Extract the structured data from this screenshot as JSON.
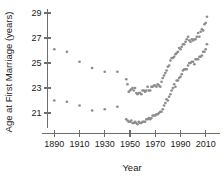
{
  "chart_data": {
    "type": "scatter",
    "title": "",
    "xlabel": "Year",
    "ylabel": "Age at First Marriage (years)",
    "xlim": [
      1885,
      2015
    ],
    "ylim": [
      19.9,
      29.4
    ],
    "xticks": [
      1890,
      1910,
      1930,
      1950,
      1970,
      1990,
      2010
    ],
    "yticks": [
      21,
      23,
      25,
      27,
      29
    ],
    "grid": false,
    "legend": "none",
    "point_color": "#8d8d8d",
    "axis_color": "#6e6e6e",
    "series": [
      {
        "name": "Men",
        "x": [
          1890,
          1900,
          1910,
          1920,
          1930,
          1940,
          1947,
          1948,
          1949,
          1950,
          1951,
          1952,
          1953,
          1954,
          1955,
          1956,
          1957,
          1958,
          1959,
          1960,
          1961,
          1962,
          1963,
          1964,
          1965,
          1966,
          1967,
          1968,
          1969,
          1970,
          1971,
          1972,
          1973,
          1974,
          1975,
          1976,
          1977,
          1978,
          1979,
          1980,
          1981,
          1982,
          1983,
          1984,
          1985,
          1986,
          1987,
          1988,
          1989,
          1990,
          1991,
          1992,
          1993,
          1994,
          1995,
          1996,
          1997,
          1998,
          1999,
          2000,
          2001,
          2002,
          2003,
          2004,
          2005,
          2006,
          2007,
          2008,
          2009,
          2010,
          2011
        ],
        "values": [
          26.1,
          25.9,
          25.1,
          24.6,
          24.3,
          24.3,
          23.7,
          23.3,
          22.7,
          22.8,
          22.9,
          23.0,
          22.8,
          23.0,
          22.6,
          22.5,
          22.6,
          22.6,
          22.5,
          22.8,
          22.8,
          22.7,
          22.8,
          23.1,
          22.8,
          22.8,
          23.1,
          23.1,
          23.2,
          23.2,
          23.1,
          23.3,
          23.2,
          23.1,
          23.5,
          23.8,
          24.0,
          24.2,
          24.4,
          24.7,
          24.8,
          25.2,
          25.4,
          25.4,
          25.5,
          25.7,
          25.8,
          25.9,
          26.2,
          26.1,
          26.3,
          26.5,
          26.5,
          26.7,
          26.9,
          27.1,
          26.8,
          26.7,
          26.9,
          26.8,
          26.9,
          26.9,
          27.1,
          27.4,
          27.1,
          27.5,
          27.7,
          27.6,
          28.1,
          28.2,
          28.7
        ]
      },
      {
        "name": "Women",
        "x": [
          1890,
          1900,
          1910,
          1920,
          1930,
          1940,
          1947,
          1948,
          1949,
          1950,
          1951,
          1952,
          1953,
          1954,
          1955,
          1956,
          1957,
          1958,
          1959,
          1960,
          1961,
          1962,
          1963,
          1964,
          1965,
          1966,
          1967,
          1968,
          1969,
          1970,
          1971,
          1972,
          1973,
          1974,
          1975,
          1976,
          1977,
          1978,
          1979,
          1980,
          1981,
          1982,
          1983,
          1984,
          1985,
          1986,
          1987,
          1988,
          1989,
          1990,
          1991,
          1992,
          1993,
          1994,
          1995,
          1996,
          1997,
          1998,
          1999,
          2000,
          2001,
          2002,
          2003,
          2004,
          2005,
          2006,
          2007,
          2008,
          2009,
          2010,
          2011
        ],
        "values": [
          22.0,
          21.9,
          21.6,
          21.2,
          21.3,
          21.5,
          20.5,
          20.4,
          20.3,
          20.3,
          20.4,
          20.2,
          20.2,
          20.3,
          20.2,
          20.1,
          20.3,
          20.2,
          20.2,
          20.3,
          20.3,
          20.3,
          20.5,
          20.5,
          20.6,
          20.5,
          20.6,
          20.8,
          20.8,
          20.8,
          20.9,
          20.9,
          21.0,
          21.1,
          21.1,
          21.3,
          21.6,
          21.8,
          22.1,
          22.0,
          22.3,
          22.5,
          22.8,
          23.0,
          23.3,
          23.1,
          23.6,
          23.6,
          23.8,
          23.9,
          24.1,
          24.4,
          24.5,
          24.5,
          24.5,
          24.8,
          25.0,
          25.0,
          25.1,
          25.1,
          24.9,
          25.3,
          25.3,
          25.3,
          25.5,
          25.5,
          25.6,
          25.9,
          25.9,
          26.1,
          26.5
        ]
      }
    ]
  }
}
